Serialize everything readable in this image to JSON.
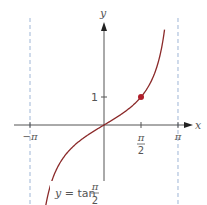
{
  "chart_data": {
    "type": "line",
    "title": "",
    "function": "y = tan(x/2)",
    "xlabel": "x",
    "ylabel": "y",
    "xticks": [
      {
        "value": -3.14159,
        "label": "−π"
      },
      {
        "value": 1.5708,
        "label_num": "π",
        "label_den": "2"
      },
      {
        "value": 3.14159,
        "label": "π"
      }
    ],
    "yticks": [
      {
        "value": 1,
        "label": "1"
      }
    ],
    "asymptotes": [
      -3.14159,
      3.14159
    ],
    "highlight_point": {
      "x": 1.5708,
      "y": 1
    },
    "curve_label": {
      "prefix": "y = tan",
      "num": "π",
      "den": "2"
    },
    "x_range": [
      -2.47,
      2.57
    ],
    "series": [
      {
        "name": "y = tan(x/2)",
        "x": [
          -2.47,
          -2.0,
          -1.5,
          -1.0,
          -0.5,
          0,
          0.5,
          1.0,
          1.5,
          2.0,
          2.57
        ],
        "values": [
          -2.86,
          -1.56,
          -0.93,
          -0.55,
          -0.26,
          0,
          0.26,
          0.55,
          0.93,
          1.56,
          3.43
        ]
      }
    ],
    "grid": false,
    "colors": {
      "curve": "#8b2a2a",
      "point": "#b01e2a",
      "axis": "#555555",
      "asymptote": "#9fb6d6"
    }
  }
}
